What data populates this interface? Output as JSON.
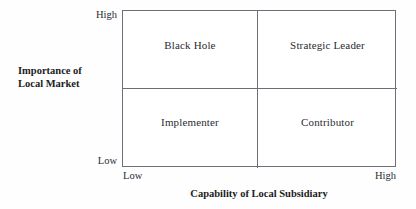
{
  "chart_data": {
    "type": "scatter",
    "title": "",
    "subtitle": "",
    "xlabel": "Capability of Local Subsidiary",
    "ylabel": "Importance of Local Market",
    "ylabel_lines": [
      "Importance of",
      "Local Market"
    ],
    "x_ticks": [
      "Low",
      "High"
    ],
    "y_ticks": [
      "Low",
      "High"
    ],
    "xlim": [
      "Low",
      "High"
    ],
    "ylim": [
      "Low",
      "High"
    ],
    "grid": false,
    "legend": "none",
    "quadrant_split_x": 0.489,
    "quadrant_split_y": 0.49,
    "quadrants": [
      {
        "id": "top-left",
        "label": "Black Hole",
        "x": "Low",
        "y": "High"
      },
      {
        "id": "top-right",
        "label": "Strategic Leader",
        "x": "High",
        "y": "High"
      },
      {
        "id": "bottom-left",
        "label": "Implementer",
        "x": "Low",
        "y": "Low"
      },
      {
        "id": "bottom-right",
        "label": "Contributor",
        "x": "High",
        "y": "Low"
      }
    ],
    "colors": {
      "background": "#fefefe",
      "plot_area": "#ffffff",
      "line": "#6e6e78",
      "text": "#2b2b33",
      "title_text": "#1c1c22"
    }
  },
  "axes": {
    "y": {
      "title_line_1": "Importance of",
      "title_line_2": "Local Market",
      "tick_high": "High",
      "tick_low": "Low"
    },
    "x": {
      "title": "Capability of Local Subsidiary",
      "tick_low": "Low",
      "tick_high": "High"
    }
  },
  "quadrant_labels": {
    "top_left": "Black Hole",
    "top_right": "Strategic Leader",
    "bottom_left": "Implementer",
    "bottom_right": "Contributor"
  }
}
